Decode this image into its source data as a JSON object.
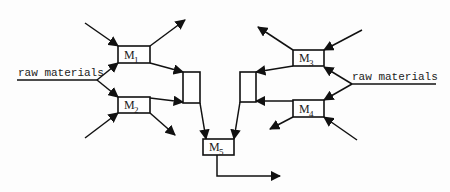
{
  "diagram": {
    "type": "production-network",
    "colors": {
      "stroke": "#111111",
      "background": "#fdfdfd"
    },
    "machines": [
      {
        "id": "M1",
        "label": "M",
        "sub": "1"
      },
      {
        "id": "M2",
        "label": "M",
        "sub": "2"
      },
      {
        "id": "M3",
        "label": "M",
        "sub": "3"
      },
      {
        "id": "M4",
        "label": "M",
        "sub": "4"
      },
      {
        "id": "M5",
        "label": "M",
        "sub": "5"
      }
    ],
    "inputs": {
      "left": "raw materials",
      "right": "raw materials"
    },
    "junctions": [
      {
        "id": "left-assembly-buffer"
      },
      {
        "id": "right-assembly-buffer"
      }
    ],
    "edges": [
      {
        "from": "external",
        "to": "M1"
      },
      {
        "from": "raw materials (left)",
        "to": "M1"
      },
      {
        "from": "raw materials (left)",
        "to": "M2"
      },
      {
        "from": "external",
        "to": "M2"
      },
      {
        "from": "M1",
        "to": "external"
      },
      {
        "from": "M2",
        "to": "external"
      },
      {
        "from": "M1",
        "to": "left-assembly-buffer"
      },
      {
        "from": "M2",
        "to": "left-assembly-buffer"
      },
      {
        "from": "external",
        "to": "M3"
      },
      {
        "from": "raw materials (right)",
        "to": "M3"
      },
      {
        "from": "raw materials (right)",
        "to": "M4"
      },
      {
        "from": "external",
        "to": "M4"
      },
      {
        "from": "M3",
        "to": "external"
      },
      {
        "from": "M4",
        "to": "external"
      },
      {
        "from": "M3",
        "to": "right-assembly-buffer"
      },
      {
        "from": "M4",
        "to": "right-assembly-buffer"
      },
      {
        "from": "left-assembly-buffer",
        "to": "M5"
      },
      {
        "from": "right-assembly-buffer",
        "to": "M5"
      },
      {
        "from": "M5",
        "to": "external"
      }
    ]
  }
}
